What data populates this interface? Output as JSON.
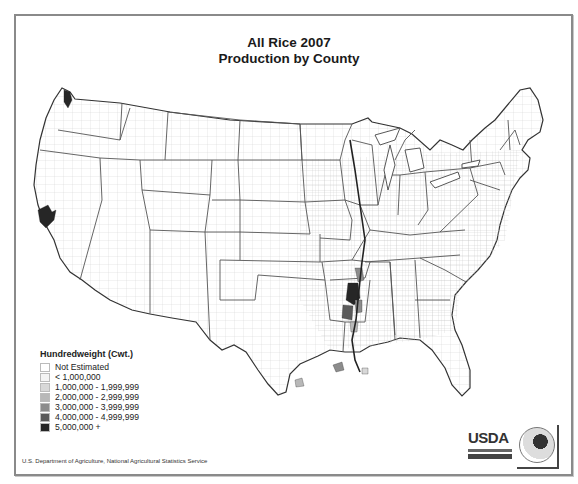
{
  "title": {
    "line1": "All Rice 2007",
    "line2": "Production by County"
  },
  "legend": {
    "title": "Hundredweight (Cwt.)",
    "items": [
      {
        "label": "Not Estimated",
        "color": "#ffffff"
      },
      {
        "label": "< 1,000,000",
        "color": "#f4f4f4"
      },
      {
        "label": "1,000,000 - 1,999,999",
        "color": "#d8d8d8"
      },
      {
        "label": "2,000,000 - 2,999,999",
        "color": "#b8b8b8"
      },
      {
        "label": "3,000,000 - 3,999,999",
        "color": "#8c8c8c"
      },
      {
        "label": "4,000,000 - 4,999,999",
        "color": "#5a5a5a"
      },
      {
        "label": "5,000,000 +",
        "color": "#262626"
      }
    ]
  },
  "source": "U.S. Department of Agriculture, National Agricultural Statistics Service",
  "logos": {
    "usda": "USDA",
    "census": "AGRICULTURE COUNTS"
  },
  "highlighted_regions": [
    {
      "name": "Sacramento Valley, CA",
      "class": "5,000,000 +"
    },
    {
      "name": "Arkansas Delta",
      "class": "5,000,000 +"
    },
    {
      "name": "Missouri Bootheel",
      "class": "3,000,000 - 3,999,999"
    },
    {
      "name": "Mississippi Delta",
      "class": "2,000,000 - 2,999,999"
    },
    {
      "name": "Southwest Louisiana",
      "class": "3,000,000 - 3,999,999"
    },
    {
      "name": "Texas Gulf Coast",
      "class": "1,000,000 - 1,999,999"
    }
  ]
}
